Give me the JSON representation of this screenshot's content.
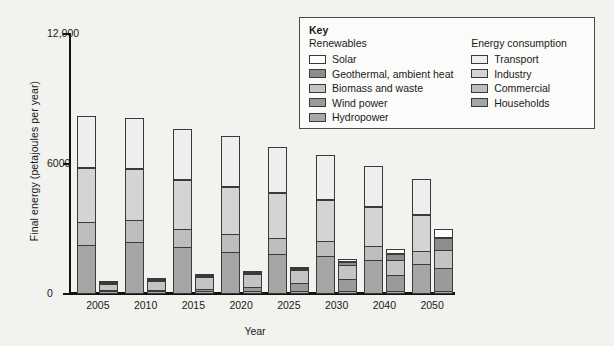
{
  "chart_data": {
    "type": "bar",
    "title": "",
    "subtitle": "",
    "xlabel": "Year",
    "ylabel": "Final energy (petajoules per year)",
    "categories": [
      "2005",
      "2010",
      "2015",
      "2020",
      "2025",
      "2030",
      "2040",
      "2050"
    ],
    "ylim": [
      0,
      12000
    ],
    "yticks": [
      0,
      6000,
      12000
    ],
    "ytick_labels": [
      "0",
      "6000",
      "12,000"
    ],
    "grid": false,
    "legend_position": "top-right",
    "stacked": true,
    "bar_pairs": "Each year shows two stacked bars: left = Energy consumption, right = Renewables",
    "groups": [
      {
        "category": "2005",
        "consumption_total": 8300,
        "renewables_total": 530,
        "consumption": [
          {
            "name": "Households",
            "value": 2250
          },
          {
            "name": "Commercial",
            "value": 1100
          },
          {
            "name": "Industry",
            "value": 2550
          },
          {
            "name": "Transport",
            "value": 2400
          }
        ],
        "renewables": [
          {
            "name": "Hydropower",
            "value": 120
          },
          {
            "name": "Wind power",
            "value": 60
          },
          {
            "name": "Biomass and waste",
            "value": 330
          },
          {
            "name": "Geothermal, ambient heat",
            "value": 15
          },
          {
            "name": "Solar",
            "value": 5
          }
        ]
      },
      {
        "category": "2010",
        "consumption_total": 8200,
        "renewables_total": 750,
        "consumption": [
          {
            "name": "Households",
            "value": 2400
          },
          {
            "name": "Commercial",
            "value": 1050
          },
          {
            "name": "Industry",
            "value": 2400
          },
          {
            "name": "Transport",
            "value": 2350
          }
        ],
        "renewables": [
          {
            "name": "Hydropower",
            "value": 120
          },
          {
            "name": "Wind power",
            "value": 110
          },
          {
            "name": "Biomass and waste",
            "value": 460
          },
          {
            "name": "Geothermal, ambient heat",
            "value": 40
          },
          {
            "name": "Solar",
            "value": 20
          }
        ]
      },
      {
        "category": "2015",
        "consumption_total": 7700,
        "renewables_total": 1000,
        "consumption": [
          {
            "name": "Households",
            "value": 2150
          },
          {
            "name": "Commercial",
            "value": 900
          },
          {
            "name": "Industry",
            "value": 2300
          },
          {
            "name": "Transport",
            "value": 2350
          }
        ],
        "renewables": [
          {
            "name": "Hydropower",
            "value": 120
          },
          {
            "name": "Wind power",
            "value": 180
          },
          {
            "name": "Biomass and waste",
            "value": 560
          },
          {
            "name": "Geothermal, ambient heat",
            "value": 80
          },
          {
            "name": "Solar",
            "value": 60
          }
        ]
      },
      {
        "category": "2020",
        "consumption_total": 7400,
        "renewables_total": 1200,
        "consumption": [
          {
            "name": "Households",
            "value": 1950
          },
          {
            "name": "Commercial",
            "value": 850
          },
          {
            "name": "Industry",
            "value": 2250
          },
          {
            "name": "Transport",
            "value": 2350
          }
        ],
        "renewables": [
          {
            "name": "Hydropower",
            "value": 120
          },
          {
            "name": "Wind power",
            "value": 270
          },
          {
            "name": "Biomass and waste",
            "value": 620
          },
          {
            "name": "Geothermal, ambient heat",
            "value": 110
          },
          {
            "name": "Solar",
            "value": 80
          }
        ]
      },
      {
        "category": "2025",
        "consumption_total": 6900,
        "renewables_total": 1400,
        "consumption": [
          {
            "name": "Households",
            "value": 1850
          },
          {
            "name": "Commercial",
            "value": 800
          },
          {
            "name": "Industry",
            "value": 2100
          },
          {
            "name": "Transport",
            "value": 2150
          }
        ],
        "renewables": [
          {
            "name": "Hydropower",
            "value": 120
          },
          {
            "name": "Wind power",
            "value": 420
          },
          {
            "name": "Biomass and waste",
            "value": 640
          },
          {
            "name": "Geothermal, ambient heat",
            "value": 130
          },
          {
            "name": "Solar",
            "value": 90
          }
        ]
      },
      {
        "category": "2030",
        "consumption_total": 6500,
        "renewables_total": 1750,
        "consumption": [
          {
            "name": "Households",
            "value": 1750
          },
          {
            "name": "Commercial",
            "value": 750
          },
          {
            "name": "Industry",
            "value": 1950
          },
          {
            "name": "Transport",
            "value": 2050
          }
        ],
        "renewables": [
          {
            "name": "Hydropower",
            "value": 130
          },
          {
            "name": "Wind power",
            "value": 600
          },
          {
            "name": "Biomass and waste",
            "value": 700
          },
          {
            "name": "Geothermal, ambient heat",
            "value": 180
          },
          {
            "name": "Solar",
            "value": 140
          }
        ]
      },
      {
        "category": "2040",
        "consumption_total": 6000,
        "renewables_total": 2200,
        "consumption": [
          {
            "name": "Households",
            "value": 1550
          },
          {
            "name": "Commercial",
            "value": 700
          },
          {
            "name": "Industry",
            "value": 1850
          },
          {
            "name": "Transport",
            "value": 1900
          }
        ],
        "renewables": [
          {
            "name": "Hydropower",
            "value": 130
          },
          {
            "name": "Wind power",
            "value": 800
          },
          {
            "name": "Biomass and waste",
            "value": 750
          },
          {
            "name": "Geothermal, ambient heat",
            "value": 300
          },
          {
            "name": "Solar",
            "value": 220
          }
        ]
      },
      {
        "category": "2050",
        "consumption_total": 5400,
        "renewables_total": 3150,
        "consumption": [
          {
            "name": "Households",
            "value": 1400
          },
          {
            "name": "Commercial",
            "value": 650
          },
          {
            "name": "Industry",
            "value": 1700
          },
          {
            "name": "Transport",
            "value": 1650
          }
        ],
        "renewables": [
          {
            "name": "Hydropower",
            "value": 130
          },
          {
            "name": "Wind power",
            "value": 1100
          },
          {
            "name": "Biomass and waste",
            "value": 900
          },
          {
            "name": "Geothermal, ambient heat",
            "value": 600
          },
          {
            "name": "Solar",
            "value": 420
          }
        ]
      }
    ]
  },
  "legend": {
    "title": "Key",
    "columns": [
      {
        "heading": "Renewables",
        "items": [
          {
            "label": "Solar",
            "color": "#ffffff"
          },
          {
            "label": "Geothermal, ambient heat",
            "color": "#8d8d8d"
          },
          {
            "label": "Biomass and waste",
            "color": "#c4c4c4"
          },
          {
            "label": "Wind power",
            "color": "#9a9a9a"
          },
          {
            "label": "Hydropower",
            "color": "#a8a8a8"
          }
        ]
      },
      {
        "heading": "Energy consumption",
        "items": [
          {
            "label": "Transport",
            "color": "#eeeeee"
          },
          {
            "label": "Industry",
            "color": "#d4d4d4"
          },
          {
            "label": "Commercial",
            "color": "#bdbdbd"
          },
          {
            "label": "Households",
            "color": "#a5a5a5"
          }
        ]
      }
    ]
  },
  "colors": {
    "background": "#f2f2ef",
    "axis": "#111111",
    "segment_border": "#3a3a3a",
    "legend_background": "#fbfbfa",
    "legend_border": "#4a4a4a",
    "solar": "#ffffff",
    "geothermal": "#8d8d8d",
    "biomass": "#c4c4c4",
    "wind": "#9a9a9a",
    "hydro": "#a8a8a8",
    "transport": "#eeeeee",
    "industry": "#d4d4d4",
    "commercial": "#bdbdbd",
    "households": "#a5a5a5"
  }
}
